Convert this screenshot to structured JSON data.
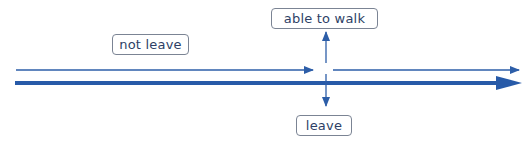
{
  "diagram": {
    "colors": {
      "line": "#2d5ea8",
      "thick_line": "#275aa8",
      "box_border": "#7b8494",
      "text": "#2e3f66"
    },
    "labels": {
      "not_leave": "not leave",
      "able_to_walk": "able to walk",
      "leave": "leave"
    }
  }
}
